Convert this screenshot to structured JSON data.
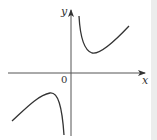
{
  "figure": {
    "type": "function-graph",
    "axes": {
      "x_label": "x",
      "y_label": "y",
      "origin_label": "0"
    },
    "curves": [
      {
        "name": "upper-right-branch",
        "description": "decreasing from near y-axis to a local minimum, then increasing"
      },
      {
        "name": "lower-left-branch",
        "description": "increasing to a local maximum, then decreasing toward the y-axis"
      }
    ],
    "colors": {
      "stroke": "#333333",
      "background": "#ffffff",
      "edge": "#ececec"
    }
  }
}
